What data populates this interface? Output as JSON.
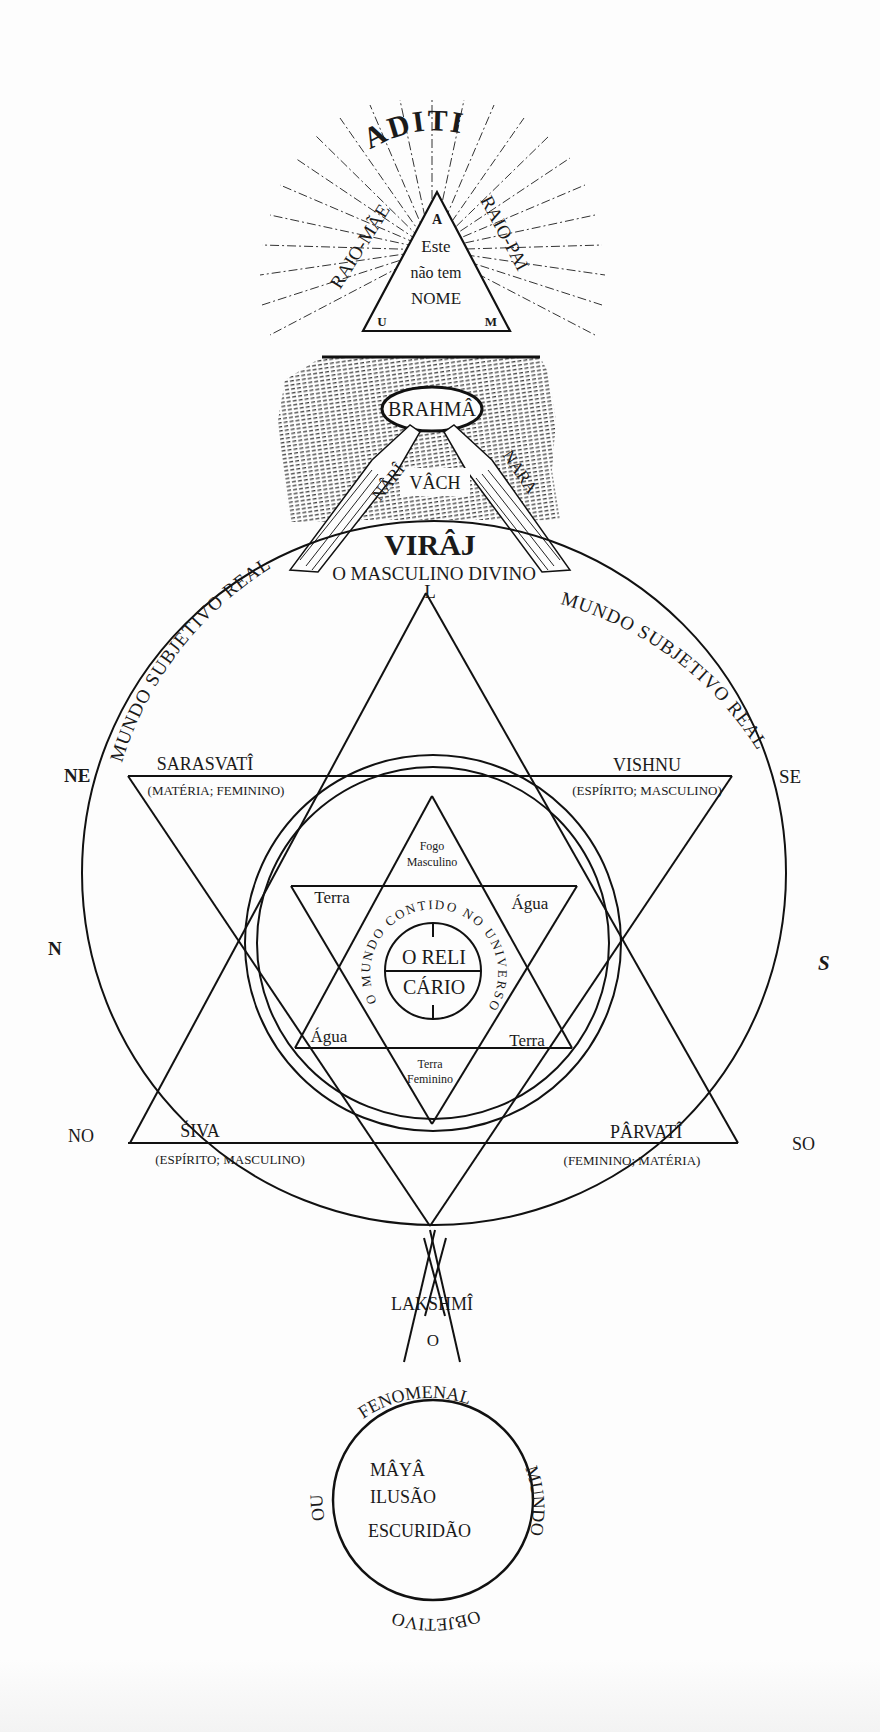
{
  "diagram": {
    "top_section": {
      "title": "ADITI",
      "ray_left": "RAIO-MÃE",
      "ray_right": "RAIO-PAI",
      "triangle": {
        "apex_letter": "A",
        "left_letter": "U",
        "right_letter": "M",
        "line1": "Este",
        "line2": "não tem",
        "line3": "NOME"
      },
      "brahma": "BRAHMÂ",
      "nari": "NÂRÎ",
      "nara": "NARA",
      "vach": "VÂCH",
      "viraj": "VIRÂJ",
      "subtitle": "O MASCULINO DIVINO"
    },
    "outer_circle": {
      "top_letter": "L",
      "arc_left": "MUNDO SUBJETIVO REAL",
      "arc_right": "MUNDO SUBJETIVO REAL",
      "directions": {
        "ne": "NE",
        "se": "SE",
        "n": "N",
        "s": "S",
        "no": "NO",
        "so": "SO"
      },
      "deities": {
        "sarasvati": {
          "name": "SARASVATÎ",
          "desc": "(MATÉRIA; FEMININO)"
        },
        "vishnu": {
          "name": "VISHNU",
          "desc": "(ESPÍRITO; MASCULINO)"
        },
        "siva": {
          "name": "ŚIVA",
          "desc": "(ESPÍRITO; MASCULINO)"
        },
        "parvati": {
          "name": "PÂRVATÎ",
          "desc": "(FEMININO; MATÉRIA)"
        },
        "lakshmi": {
          "name": "LAKSHMÎ"
        }
      }
    },
    "inner_star": {
      "top_line1": "Fogo",
      "top_line2": "Masculino",
      "upper_left": "Terra",
      "upper_right": "Água",
      "lower_left": "Água",
      "lower_right": "Terra",
      "bottom_line1": "Terra",
      "bottom_line2": "Feminino",
      "ring_text": "O MUNDO CONTIDO NO UNIVERSO",
      "center_top": "O RELI",
      "center_bottom": "CÁRIO"
    },
    "lower_section": {
      "connector": "O",
      "arc_top": "FENOMENAL",
      "arc_right": "MUNDO",
      "arc_bottom": "OBJETIVO",
      "arc_left": "OU",
      "line1": "MÂYÂ",
      "line2": "ILUSÃO",
      "line3": "ESCURIDÃO"
    }
  }
}
